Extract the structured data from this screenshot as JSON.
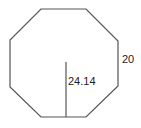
{
  "diagram": {
    "shape": "regular-octagon",
    "stroke_color": "#555555",
    "vertices": [
      [
        41,
        9
      ],
      [
        86,
        9
      ],
      [
        118,
        41
      ],
      [
        118,
        86
      ],
      [
        86,
        117
      ],
      [
        41,
        117
      ],
      [
        10,
        87
      ],
      [
        10,
        40
      ]
    ],
    "apothem_line": {
      "x": 66,
      "y1": 62,
      "y2": 117
    },
    "labels": {
      "side_length": "20",
      "apothem": "24.14"
    }
  }
}
